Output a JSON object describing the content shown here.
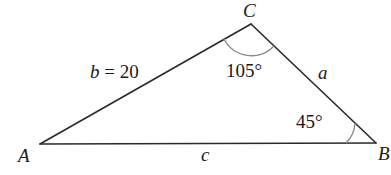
{
  "diagram": {
    "type": "triangle",
    "vertices": {
      "A": {
        "label": "A",
        "x": 40,
        "y": 144
      },
      "B": {
        "label": "B",
        "x": 376,
        "y": 143
      },
      "C": {
        "label": "C",
        "x": 251,
        "y": 24
      }
    },
    "sides": {
      "b": {
        "label": "b = 20",
        "between": [
          "A",
          "C"
        ]
      },
      "a": {
        "label": "a",
        "between": [
          "C",
          "B"
        ]
      },
      "c": {
        "label": "c",
        "between": [
          "A",
          "B"
        ]
      }
    },
    "angles": {
      "C": {
        "label": "105°"
      },
      "B": {
        "label": "45°"
      }
    },
    "colors": {
      "lines": "#2a2a2a",
      "arcs": "#8a8a8a",
      "text": "#1a1a1a",
      "background": "#ffffff"
    }
  }
}
